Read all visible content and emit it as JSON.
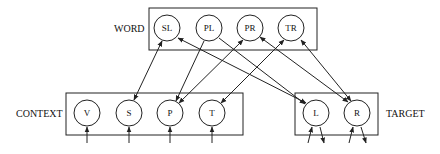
{
  "groups": {
    "word": {
      "label": "WORD",
      "nodes": [
        "SL",
        "PL",
        "PR",
        "TR"
      ]
    },
    "context": {
      "label": "CONTEXT",
      "nodes": [
        "V",
        "S",
        "P",
        "T"
      ]
    },
    "target": {
      "label": "TARGET",
      "nodes": [
        "L",
        "R"
      ]
    }
  },
  "edges": [
    {
      "from": "SL",
      "to": "S",
      "bidirectional": true
    },
    {
      "from": "PL",
      "to": "P"
    },
    {
      "from": "PR",
      "to": "P"
    },
    {
      "from": "TR",
      "to": "T"
    },
    {
      "from": "SL",
      "to": "L",
      "bidirectional": true
    },
    {
      "from": "PL",
      "to": "L"
    },
    {
      "from": "PR",
      "to": "R",
      "bidirectional": true
    },
    {
      "from": "TR",
      "to": "R",
      "bidirectional": true
    }
  ],
  "inputs": [
    "V",
    "S",
    "P",
    "T"
  ],
  "outputs": [
    "L",
    "R"
  ]
}
